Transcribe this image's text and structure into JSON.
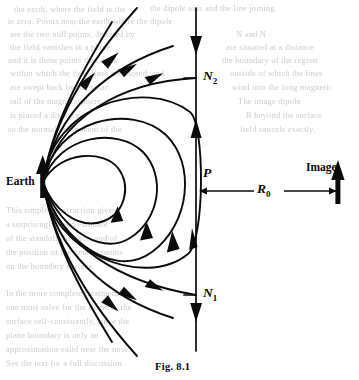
{
  "figure": {
    "caption": "Fig. 8.1",
    "background_color": "#ffffff",
    "ink_color": "#0b0b0b",
    "bleed_color": "#c9c4bd"
  },
  "labels": {
    "earth": "Earth",
    "image": "Image",
    "point_p": "P",
    "neutral_point_upper": "N",
    "neutral_point_upper_sub": "2",
    "neutral_point_lower": "N",
    "neutral_point_lower_sub": "1",
    "distance": "R",
    "distance_sub": "0"
  },
  "diagram_data": {
    "type": "field-line-diagram",
    "earth_position": [
      43,
      182
    ],
    "boundary_line_x": 196,
    "boundary_line_y_range": [
      8,
      351
    ],
    "image_arrow_x": 338,
    "neutral_point_upper_y": 78,
    "neutral_point_lower_y": 295,
    "point_p_y": 182,
    "dimension_line_y": 191,
    "dimension_from_x": 196,
    "dimension_to_x": 338,
    "closed_loop_count": 4,
    "open_line_count_upper": 4,
    "open_line_count_lower": 4,
    "dipole_arrow_direction": "up",
    "image_arrow_direction": "up",
    "boundary_flow_upper_direction": "down",
    "boundary_flow_lower_direction": "down"
  },
  "bleed_text": {
    "lines": [
      {
        "text": "the earth, where the field is the",
        "x": 14,
        "y": 4
      },
      {
        "text": "the dipole axis and the line joining",
        "x": 150,
        "y": 3
      },
      {
        "text": "is zero. Points near the earth where the dipole",
        "x": 8,
        "y": 16
      },
      {
        "text": "are the two null points, denoted by",
        "x": 10,
        "y": 29
      },
      {
        "text": "N and N",
        "x": 236,
        "y": 29
      },
      {
        "text": "the field vanishes in a plane",
        "x": 10,
        "y": 42
      },
      {
        "text": "are situated at a distance",
        "x": 226,
        "y": 42
      },
      {
        "text": "and it is these points that mark",
        "x": 8,
        "y": 55
      },
      {
        "text": "the boundary of the region",
        "x": 222,
        "y": 55
      },
      {
        "text": "within which the field lines are closed, and",
        "x": 10,
        "y": 68
      },
      {
        "text": "outside of which the lines",
        "x": 230,
        "y": 68
      },
      {
        "text": "are swept back by the solar",
        "x": 10,
        "y": 82
      },
      {
        "text": "wind into the long magnetic",
        "x": 232,
        "y": 82
      },
      {
        "text": "tail of the magnetosphere.",
        "x": 10,
        "y": 96
      },
      {
        "text": "The image dipole",
        "x": 238,
        "y": 96
      },
      {
        "text": "is placed a distance",
        "x": 10,
        "y": 110
      },
      {
        "text": "R beyond the surface",
        "x": 246,
        "y": 110
      },
      {
        "text": "so the normal component of the",
        "x": 8,
        "y": 124
      },
      {
        "text": "field cancels exactly.",
        "x": 240,
        "y": 124
      },
      {
        "text": "This simple construction gives",
        "x": 6,
        "y": 205
      },
      {
        "text": "a surprisingly good estimate",
        "x": 6,
        "y": 219
      },
      {
        "text": "of the standoff distance, and of",
        "x": 6,
        "y": 233
      },
      {
        "text": "the position of the neutral points",
        "x": 6,
        "y": 247
      },
      {
        "text": "on the boundary surface.",
        "x": 6,
        "y": 261
      },
      {
        "text": "In the more complete treatment",
        "x": 6,
        "y": 288
      },
      {
        "text": "one must solve for the shape of the",
        "x": 6,
        "y": 302
      },
      {
        "text": "surface self-consistently, since the",
        "x": 6,
        "y": 316
      },
      {
        "text": "plane boundary is only an",
        "x": 6,
        "y": 330
      },
      {
        "text": "approximation valid near the nose.",
        "x": 6,
        "y": 344
      },
      {
        "text": "See the text for a full discussion.",
        "x": 6,
        "y": 358
      }
    ]
  }
}
